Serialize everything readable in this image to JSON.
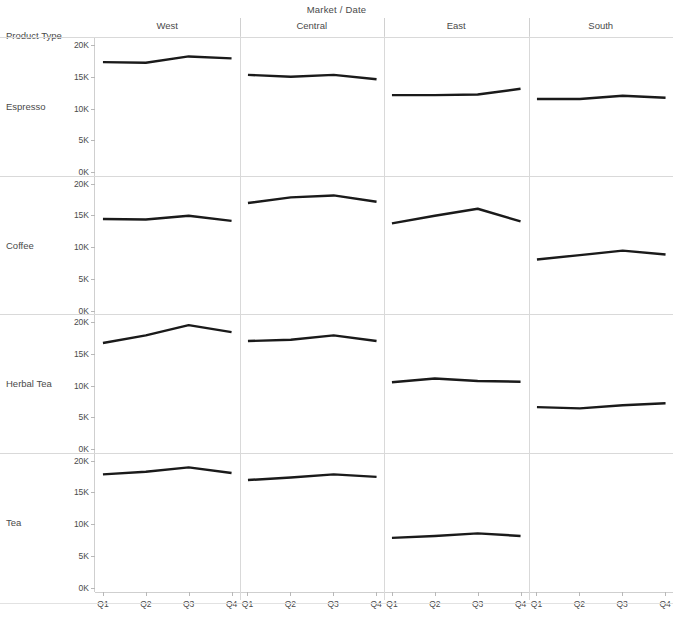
{
  "chart_data": {
    "type": "line",
    "title": "Market / Date",
    "corner_label": "Product Type",
    "xlabel": "",
    "ylabel": "",
    "x": [
      "Q1",
      "Q2",
      "Q3",
      "Q4"
    ],
    "ylim": [
      0,
      20000
    ],
    "yticks": [
      0,
      5000,
      10000,
      15000,
      20000
    ],
    "ytick_labels": [
      "0K",
      "5K",
      "10K",
      "15K",
      "20K"
    ],
    "grid": false,
    "legend": "none",
    "columns": [
      "West",
      "Central",
      "East",
      "South"
    ],
    "rows": [
      "Espresso",
      "Coffee",
      "Herbal Tea",
      "Tea"
    ],
    "line_color": "#1a1a1a",
    "panels": [
      {
        "row": "Espresso",
        "column": "West",
        "values": [
          17300,
          17200,
          18200,
          17900
        ]
      },
      {
        "row": "Espresso",
        "column": "Central",
        "values": [
          15300,
          15000,
          15300,
          14600
        ]
      },
      {
        "row": "Espresso",
        "column": "East",
        "values": [
          12100,
          12100,
          12200,
          13100
        ]
      },
      {
        "row": "Espresso",
        "column": "South",
        "values": [
          11500,
          11500,
          12000,
          11700
        ]
      },
      {
        "row": "Coffee",
        "column": "West",
        "values": [
          14500,
          14400,
          15000,
          14200
        ]
      },
      {
        "row": "Coffee",
        "column": "Central",
        "values": [
          17000,
          17900,
          18200,
          17200
        ]
      },
      {
        "row": "Coffee",
        "column": "East",
        "values": [
          13800,
          15000,
          16100,
          14100
        ]
      },
      {
        "row": "Coffee",
        "column": "South",
        "values": [
          8100,
          8800,
          9500,
          8900
        ]
      },
      {
        "row": "Herbal Tea",
        "column": "West",
        "values": [
          16700,
          17900,
          19500,
          18400
        ]
      },
      {
        "row": "Herbal Tea",
        "column": "Central",
        "values": [
          17000,
          17200,
          17900,
          17000
        ]
      },
      {
        "row": "Herbal Tea",
        "column": "East",
        "values": [
          10500,
          11100,
          10700,
          10600
        ]
      },
      {
        "row": "Herbal Tea",
        "column": "South",
        "values": [
          6600,
          6400,
          6900,
          7200
        ]
      },
      {
        "row": "Tea",
        "column": "West",
        "values": [
          17900,
          18300,
          19000,
          18100
        ]
      },
      {
        "row": "Tea",
        "column": "Central",
        "values": [
          17000,
          17400,
          17900,
          17500
        ]
      },
      {
        "row": "Tea",
        "column": "East",
        "values": [
          7900,
          8200,
          8600,
          8200
        ]
      },
      {
        "row": "Tea",
        "column": "South",
        "values": []
      }
    ]
  }
}
